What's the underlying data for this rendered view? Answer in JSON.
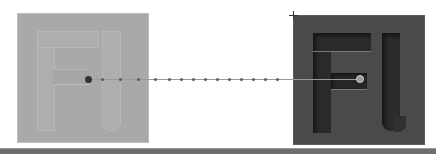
{
  "canvas": {
    "background": "#ffffff",
    "left_tile": {
      "glyph_text": "Fl",
      "style": "faint embossed",
      "color": "#a9a9a9"
    },
    "right_tile": {
      "glyph_text": "Fl",
      "style": "engraved / carved",
      "color": "#4a4a4a"
    },
    "motion_path": {
      "dot_count": 14,
      "start_handle": "filled-dot",
      "end_handle": "ring-handle"
    },
    "bottom_bar_color": "#6e6e6e"
  }
}
